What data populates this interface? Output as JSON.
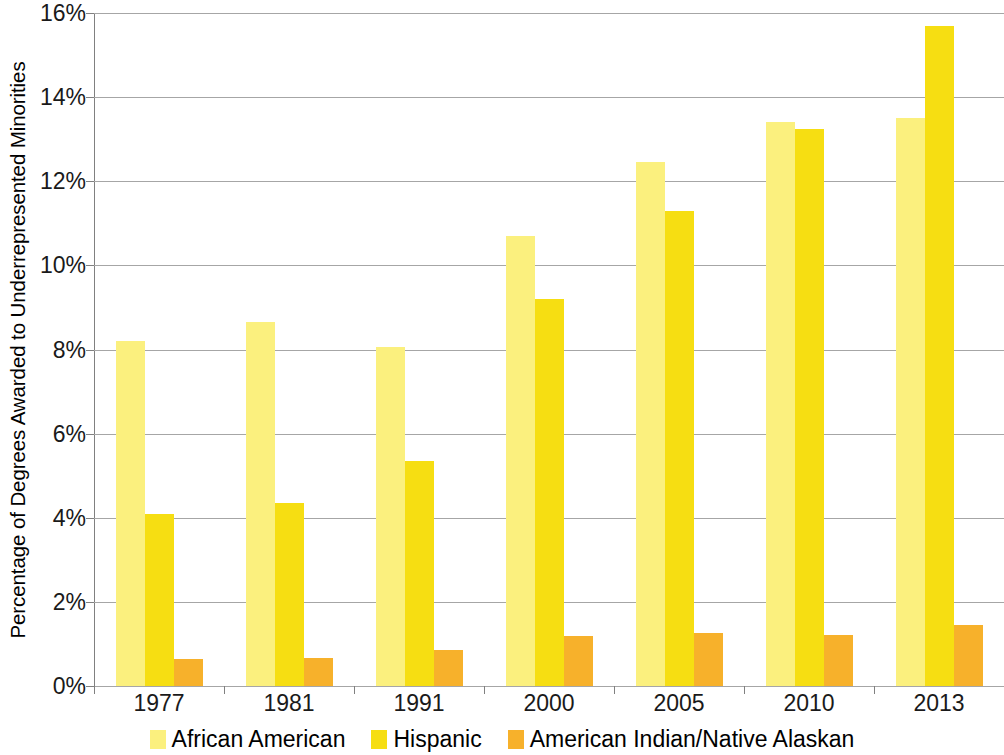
{
  "chart_data": {
    "type": "bar",
    "title": "",
    "subtitle": "",
    "xlabel": "",
    "ylabel": "Percentage of Degrees Awarded to Underrepresented Minorities",
    "categories": [
      "1977",
      "1981",
      "1991",
      "2000",
      "2005",
      "2010",
      "2013"
    ],
    "series": [
      {
        "name": "African American",
        "color": "#FBF07E",
        "values": [
          8.2,
          8.65,
          8.05,
          10.7,
          12.45,
          13.4,
          13.5
        ]
      },
      {
        "name": "Hispanic",
        "color": "#F6DE12",
        "values": [
          4.1,
          4.35,
          5.35,
          9.2,
          11.3,
          13.25,
          15.7
        ]
      },
      {
        "name": "American Indian/Native Alaskan",
        "color": "#F7B12B",
        "values": [
          0.65,
          0.67,
          0.85,
          1.18,
          1.25,
          1.22,
          1.45
        ]
      }
    ],
    "ylim": [
      0,
      16
    ],
    "ytick_values": [
      0,
      2,
      4,
      6,
      8,
      10,
      12,
      14,
      16
    ],
    "ytick_labels": [
      "0%",
      "2%",
      "4%",
      "6%",
      "8%",
      "10%",
      "12%",
      "14%",
      "16%"
    ],
    "grid": true,
    "grid_axis": "y",
    "legend_position": "bottom",
    "value_unit": "%",
    "bar_layout": "grouped"
  },
  "legend": {
    "items": [
      {
        "label": "African American",
        "color": "#FBF07E"
      },
      {
        "label": "Hispanic",
        "color": "#F6DE12"
      },
      {
        "label": "American Indian/Native Alaskan",
        "color": "#F7B12B"
      }
    ]
  },
  "colors": {
    "background": "#FFFFFF",
    "gridline": "#A6A6A6",
    "axis": "#808080",
    "text": "#1A1A1A",
    "series_african_american": "#FBF07E",
    "series_hispanic": "#F6DE12",
    "series_american_indian": "#F7B12B"
  }
}
